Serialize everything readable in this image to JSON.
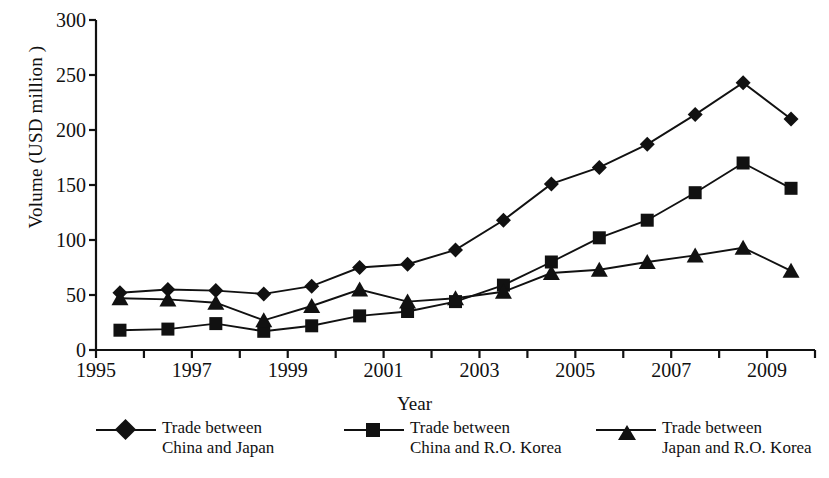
{
  "chart_data": {
    "type": "line",
    "title": "",
    "xlabel": "Year",
    "ylabel": "Volume (USD million )",
    "xlim": [
      1995,
      2010
    ],
    "ylim": [
      0,
      300
    ],
    "grid": false,
    "legend_position": "bottom",
    "x": [
      1995.5,
      1996.5,
      1997.5,
      1998.5,
      1999.5,
      2000.5,
      2001.5,
      2002.5,
      2003.5,
      2004.5,
      2005.5,
      2006.5,
      2007.5,
      2008.5,
      2009.5
    ],
    "xtick_labels": [
      "1995",
      "1997",
      "1999",
      "2001",
      "2003",
      "2005",
      "2007",
      "2009"
    ],
    "xtick_values": [
      1995,
      1997,
      1999,
      2001,
      2003,
      2005,
      2007,
      2009
    ],
    "ytick_labels": [
      "0",
      "50",
      "100",
      "150",
      "200",
      "250",
      "300"
    ],
    "ytick_values": [
      0,
      50,
      100,
      150,
      200,
      250,
      300
    ],
    "series": [
      {
        "name": "Trade between China and Japan",
        "name_line1": "Trade between",
        "name_line2": "China and Japan",
        "marker": "diamond",
        "color": "#111111",
        "values": [
          52,
          55,
          54,
          51,
          58,
          75,
          78,
          91,
          118,
          151,
          166,
          187,
          214,
          243,
          210
        ]
      },
      {
        "name": "Trade between China and R.O. Korea",
        "name_line1": "Trade between",
        "name_line2": "China and R.O. Korea",
        "marker": "square",
        "color": "#111111",
        "values": [
          18,
          19,
          24,
          17,
          22,
          31,
          35,
          44,
          59,
          80,
          102,
          118,
          143,
          170,
          147
        ]
      },
      {
        "name": "Trade between Japan and R.O. Korea",
        "name_line1": "Trade between",
        "name_line2": "Japan and R.O. Korea",
        "marker": "triangle",
        "color": "#111111",
        "values": [
          47,
          46,
          43,
          27,
          40,
          55,
          44,
          47,
          53,
          70,
          73,
          80,
          86,
          93,
          72
        ]
      }
    ]
  },
  "axis": {
    "line_color": "#111111"
  }
}
